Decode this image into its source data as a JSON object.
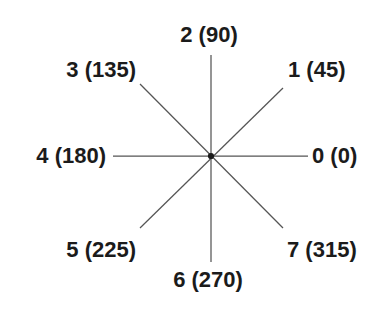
{
  "figure": {
    "background_color": "#ffffff",
    "line_color": "#555555",
    "text_color": "#1b1b1b",
    "center": {
      "x": 211,
      "y": 156
    },
    "ray_length_axis": 100,
    "ray_length_diagonal": 72
  },
  "directions": [
    {
      "index": "0",
      "angle_deg": "0",
      "label": "0 (0)",
      "name": "east",
      "anchor": "left",
      "label_x": 312,
      "label_y": 145
    },
    {
      "index": "1",
      "angle_deg": "45",
      "label": "1 (45)",
      "name": "northeast",
      "anchor": "left",
      "label_x": 288,
      "label_y": 59
    },
    {
      "index": "2",
      "angle_deg": "90",
      "label": "2 (90)",
      "name": "north",
      "anchor": "center",
      "label_x": 209,
      "label_y": 24
    },
    {
      "index": "3",
      "angle_deg": "135",
      "label": "3 (135)",
      "name": "northwest",
      "anchor": "right",
      "label_x": 136,
      "label_y": 59
    },
    {
      "index": "4",
      "angle_deg": "180",
      "label": "4 (180)",
      "name": "west",
      "anchor": "right",
      "label_x": 106,
      "label_y": 145
    },
    {
      "index": "5",
      "angle_deg": "225",
      "label": "5 (225)",
      "name": "southwest",
      "anchor": "right",
      "label_x": 136,
      "label_y": 239
    },
    {
      "index": "6",
      "angle_deg": "270",
      "label": "6 (270)",
      "name": "south",
      "anchor": "center",
      "label_x": 208,
      "label_y": 269
    },
    {
      "index": "7",
      "angle_deg": "315",
      "label": "7 (315)",
      "name": "southeast",
      "anchor": "left",
      "label_x": 287,
      "label_y": 239
    }
  ],
  "rays": [
    {
      "name": "ray-east-west",
      "x1": 113,
      "y1": 156,
      "x2": 308,
      "y2": 156
    },
    {
      "name": "ray-north-south",
      "x1": 211,
      "y1": 55,
      "x2": 211,
      "y2": 262
    },
    {
      "name": "ray-northeast-southwest",
      "x1": 283,
      "y1": 88,
      "x2": 140,
      "y2": 228
    },
    {
      "name": "ray-northwest-southeast",
      "x1": 140,
      "y1": 84,
      "x2": 283,
      "y2": 228
    }
  ]
}
